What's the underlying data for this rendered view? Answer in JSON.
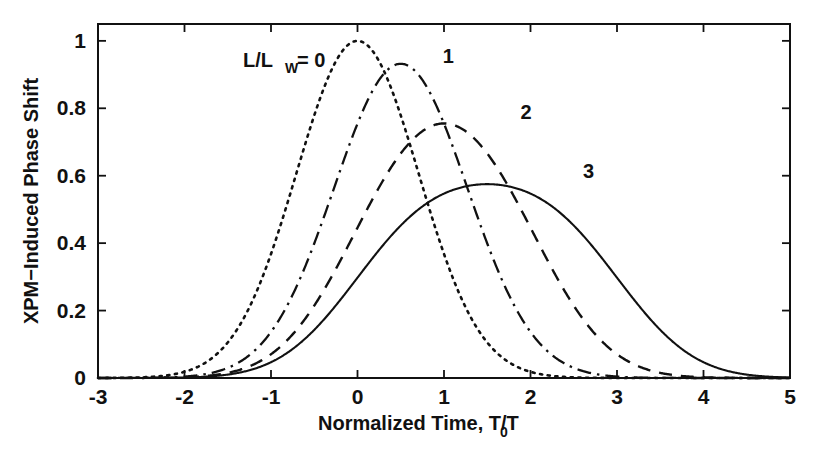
{
  "figure": {
    "title": "",
    "background_color": "#ffffff",
    "line_color": "#111111"
  },
  "chart_data": {
    "type": "line",
    "title": "",
    "subtitle": "",
    "xlabel_main": "Normalized Time, T/T",
    "xlabel_sub": "0",
    "ylabel": "XPM−Induced Phase Shift",
    "xlim": [
      -3,
      5
    ],
    "ylim": [
      0,
      1.05
    ],
    "grid": false,
    "legend_position": "inline-annotations",
    "xticks": [
      -3,
      -2,
      -1,
      0,
      1,
      2,
      3,
      4,
      5
    ],
    "xticklabels": [
      "-3",
      "-2",
      "-1",
      "0",
      "1",
      "2",
      "3",
      "4",
      "5"
    ],
    "yticks": [
      0,
      0.2,
      0.4,
      0.6,
      0.8,
      1
    ],
    "yticklabels": [
      "0",
      "0.2",
      "0.4",
      "0.6",
      "0.8",
      "1"
    ],
    "legend_prefix": "L/L",
    "legend_subscript": "W",
    "legend_equals": "= 0",
    "series": [
      {
        "name": "0",
        "label": "L/L_W = 0",
        "linestyle": "dotted",
        "walkoff": 0,
        "peak_x": 0.0,
        "peak_y": 1.0,
        "label_x": -1.1,
        "label_y": 0.925
      },
      {
        "name": "1",
        "label": "1",
        "linestyle": "dashdot",
        "walkoff": 1,
        "peak_x": 0.5,
        "peak_y": 0.932,
        "label_x": 1.05,
        "label_y": 0.955
      },
      {
        "name": "2",
        "label": "2",
        "linestyle": "dashed",
        "walkoff": 2,
        "peak_x": 1.0,
        "peak_y": 0.755,
        "label_x": 1.95,
        "label_y": 0.79
      },
      {
        "name": "3",
        "label": "3",
        "linestyle": "solid",
        "walkoff": 3,
        "peak_x": 1.5,
        "peak_y": 0.575,
        "label_x": 2.67,
        "label_y": 0.615
      }
    ],
    "x": [
      -3,
      -2.8,
      -2.6,
      -2.4,
      -2.2,
      -2,
      -1.8,
      -1.6,
      -1.4,
      -1.2,
      -1,
      -0.8,
      -0.6,
      -0.4,
      -0.2,
      0,
      0.2,
      0.4,
      0.6,
      0.8,
      1,
      1.2,
      1.4,
      1.6,
      1.8,
      2,
      2.2,
      2.4,
      2.6,
      2.8,
      3,
      3.2,
      3.4,
      3.6,
      3.8,
      4,
      4.2,
      4.4,
      4.6,
      4.8,
      5
    ],
    "series_values": {
      "0": [
        0.0001,
        0.0004,
        0.0012,
        0.0032,
        0.0079,
        0.0183,
        0.0392,
        0.0773,
        0.1409,
        0.2369,
        0.3679,
        0.5273,
        0.6977,
        0.8521,
        0.9608,
        1.0,
        0.9608,
        0.8521,
        0.6977,
        0.5273,
        0.3679,
        0.2369,
        0.1409,
        0.0773,
        0.0392,
        0.0183,
        0.0079,
        0.0032,
        0.0012,
        0.0004,
        0.0001,
        0.0,
        0.0,
        0.0,
        0.0,
        0.0,
        0.0,
        0.0,
        0.0,
        0.0,
        0.0
      ],
      "1": [
        0.0002,
        0.0007,
        0.0021,
        0.0054,
        0.0132,
        0.0299,
        0.0626,
        0.1206,
        0.2137,
        0.3474,
        0.5163,
        0.6995,
        0.8585,
        0.9492,
        0.9408,
        0.8859,
        0.886,
        0.9408,
        0.9492,
        0.8585,
        0.6995,
        0.5163,
        0.3474,
        0.2137,
        0.1206,
        0.0626,
        0.0299,
        0.0132,
        0.0054,
        0.0021,
        0.0007,
        0.0002,
        0.0001,
        0.0,
        0.0,
        0.0,
        0.0,
        0.0,
        0.0,
        0.0,
        0.0
      ],
      "2": [
        0.0004,
        0.0012,
        0.0034,
        0.0088,
        0.0212,
        0.0471,
        0.0964,
        0.1812,
        0.3122,
        0.4886,
        0.6901,
        0.8693,
        0.9723,
        0.9717,
        0.9044,
        0.8427,
        0.8427,
        0.9044,
        0.9717,
        0.9723,
        0.8693,
        0.6901,
        0.4886,
        0.3122,
        0.1812,
        0.0964,
        0.0471,
        0.0212,
        0.0088,
        0.0034,
        0.0012,
        0.0004,
        0.0001,
        0.0,
        0.0,
        0.0,
        0.0,
        0.0,
        0.0,
        0.0,
        0.0
      ],
      "3": [
        0.0006,
        0.0017,
        0.0048,
        0.0124,
        0.0294,
        0.0644,
        0.1297,
        0.2393,
        0.4034,
        0.6134,
        0.8344,
        0.9929,
        1.0,
        0.9165,
        0.8266,
        0.7753,
        0.7753,
        0.8266,
        0.9165,
        1.0,
        0.9929,
        0.8344,
        0.6134,
        0.4034,
        0.2393,
        0.1297,
        0.0644,
        0.0294,
        0.0124,
        0.0048,
        0.0017,
        0.0006,
        0.0002,
        0.0,
        0.0,
        0.0,
        0.0,
        0.0,
        0.0,
        0.0,
        0.0
      ]
    },
    "note": "Each curve d = L/L_W is the walk-off averaged Gaussian phase shift phi(tau) = (1/d) * integral_0^d exp(-(tau - s)^2) ds, normalized so the d=0 curve peaks at 1.0."
  }
}
